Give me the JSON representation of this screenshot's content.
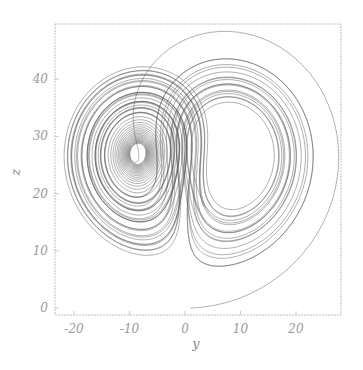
{
  "chart_data": {
    "type": "line",
    "title": "",
    "subtitle": "Lorenz attractor projected onto the y–z plane",
    "xlabel": "y",
    "ylabel": "z",
    "xlim": [
      -24,
      29
    ],
    "ylim": [
      -1,
      49
    ],
    "xticks": [
      -20,
      -10,
      0,
      10,
      20
    ],
    "yticks": [
      0,
      10,
      20,
      30,
      40
    ],
    "xtick_labels": [
      "-20",
      "-10",
      "0",
      "10",
      "20"
    ],
    "ytick_labels": [
      "0",
      "10",
      "20",
      "30",
      "40"
    ],
    "grid": false,
    "legend": null,
    "series": [
      {
        "name": "trajectory",
        "color": "#555555",
        "sigma": 10,
        "rho": 28,
        "beta": 2.6666667,
        "initial": {
          "x": 0,
          "y": 1,
          "z": 0
        },
        "description": "Trajectory starts near (y=1, z=0), swings out to y≈28, z≈48, then spirals around two lobes centered near (y≈-8.5, z≈27) and (y≈8.5, z≈27)"
      }
    ],
    "annotations": []
  },
  "axes": {
    "x_label": "y",
    "y_label": "z",
    "x_ticks": [
      "-20",
      "-10",
      "0",
      "10",
      "20"
    ],
    "y_ticks": [
      "0",
      "10",
      "20",
      "30",
      "40"
    ]
  },
  "colors": {
    "line": "#555555",
    "frame": "#bdbdbd",
    "tick_text": "#9a9a9a",
    "background": "#ffffff"
  }
}
